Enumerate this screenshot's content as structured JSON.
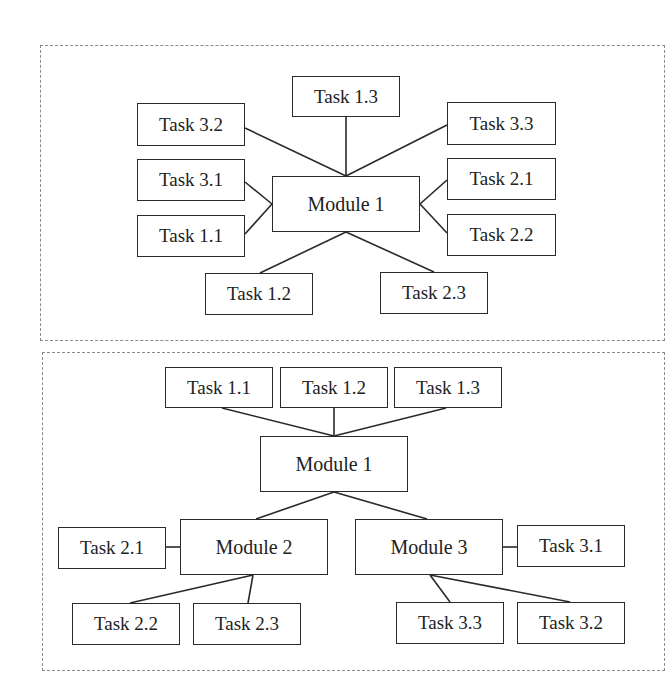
{
  "top_panel": {
    "center": {
      "label": "Module 1"
    },
    "tasks": [
      {
        "label": "Task 1.3"
      },
      {
        "label": "Task 3.2"
      },
      {
        "label": "Task 3.3"
      },
      {
        "label": "Task 3.1"
      },
      {
        "label": "Task 2.1"
      },
      {
        "label": "Task 1.1"
      },
      {
        "label": "Task 2.2"
      },
      {
        "label": "Task 1.2"
      },
      {
        "label": "Task 2.3"
      }
    ]
  },
  "bottom_panel": {
    "root": {
      "label": "Module 1"
    },
    "root_tasks": [
      {
        "label": "Task 1.1"
      },
      {
        "label": "Task 1.2"
      },
      {
        "label": "Task 1.3"
      }
    ],
    "module2": {
      "label": "Module 2",
      "tasks": [
        {
          "label": "Task 2.1"
        },
        {
          "label": "Task 2.2"
        },
        {
          "label": "Task 2.3"
        }
      ]
    },
    "module3": {
      "label": "Module 3",
      "tasks": [
        {
          "label": "Task 3.1"
        },
        {
          "label": "Task 3.3"
        },
        {
          "label": "Task 3.2"
        }
      ]
    }
  }
}
